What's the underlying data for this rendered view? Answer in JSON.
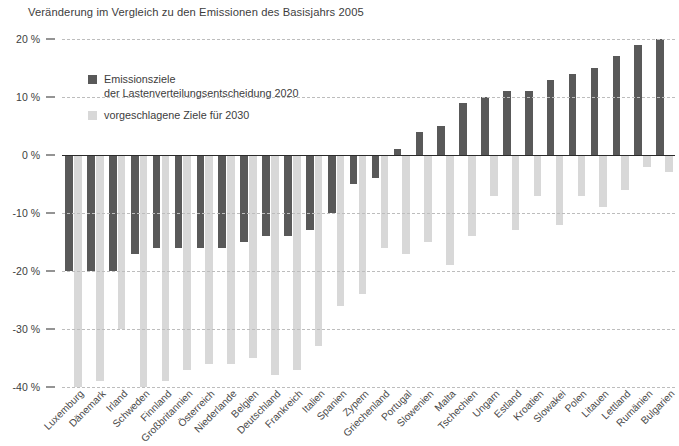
{
  "chart_data": {
    "type": "bar",
    "title": "Veränderung im Vergleich zu den Emissionen des Basisjahrs 2005",
    "xlabel": "",
    "ylabel": "",
    "ylim": [
      -40,
      20
    ],
    "yticks": [
      20,
      10,
      0,
      -10,
      -20,
      -30,
      -40
    ],
    "ytick_labels": [
      "20 %",
      "10 %",
      "0 %",
      "-10 %",
      "-20 %",
      "-30 %",
      "-40 %"
    ],
    "grid": true,
    "legend_position": "upper-left",
    "categories": [
      "Luxemburg",
      "Dänemark",
      "Irland",
      "Schweden",
      "Finnland",
      "Großbritannien",
      "Österreich",
      "Niederlande",
      "Belgien",
      "Deutschland",
      "Frankreich",
      "Italien",
      "Spanien",
      "Zypern",
      "Griechenland",
      "Portugal",
      "Slowenien",
      "Malta",
      "Tschechien",
      "Ungarn",
      "Estland",
      "Kroatien",
      "Slowakei",
      "Polen",
      "Litauen",
      "Lettland",
      "Rumänien",
      "Bulgarien"
    ],
    "series": [
      {
        "name": "Emissionsziele der Lastenverteilungsentscheidung 2020",
        "color": "#595959",
        "values": [
          -20,
          -20,
          -20,
          -17,
          -16,
          -16,
          -16,
          -16,
          -15,
          -14,
          -14,
          -13,
          -10,
          -5,
          -4,
          1,
          4,
          5,
          9,
          10,
          11,
          11,
          13,
          14,
          15,
          17,
          19,
          20
        ]
      },
      {
        "name": "vorgeschlagene Ziele für 2030",
        "color": "#d8d8d8",
        "values": [
          -40,
          -39,
          -30,
          -40,
          -39,
          -37,
          -36,
          -36,
          -35,
          -38,
          -37,
          -33,
          -26,
          -24,
          -16,
          -17,
          -15,
          -19,
          -14,
          -7,
          -13,
          -7,
          -12,
          -7,
          -9,
          -6,
          -2,
          -3
        ]
      }
    ]
  },
  "legend": {
    "items": [
      {
        "label": "Emissionsziele\nder Lastenverteilungsentscheidung 2020",
        "swatch": "dark"
      },
      {
        "label": "vorgeschlagene Ziele für 2030",
        "swatch": "light"
      }
    ]
  }
}
